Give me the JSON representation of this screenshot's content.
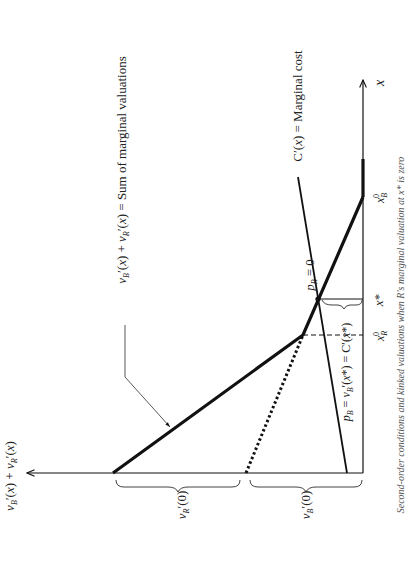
{
  "diagram": {
    "orientation": "rotated 90 degrees counterclockwise",
    "axes": {
      "x_label": "x",
      "y_label": "v_B′(x) + v_R′(x)"
    },
    "curves": {
      "sum": {
        "label": "v_B′(x) + v_R′(x) = Sum of marginal valuations"
      },
      "marginal_cost": {
        "label": "C′(x) = Marginal cost"
      },
      "v_B_dotted": {
        "style": "dotted"
      }
    },
    "annotations": {
      "pR": "p_R = 0",
      "pB": "p_B = v_B′(x*) = C′(x*)",
      "x_star": "x*",
      "xR0": "x_R^0",
      "xB0": "x_B^0",
      "vR0": "v_R′(0)",
      "vB0": "v_B′(0)"
    },
    "caption": "Second-order conditions and kinked valuations when R's marginal valuation at x* is zero"
  },
  "colors": {
    "ink": "#111111",
    "background": "#ffffff"
  }
}
